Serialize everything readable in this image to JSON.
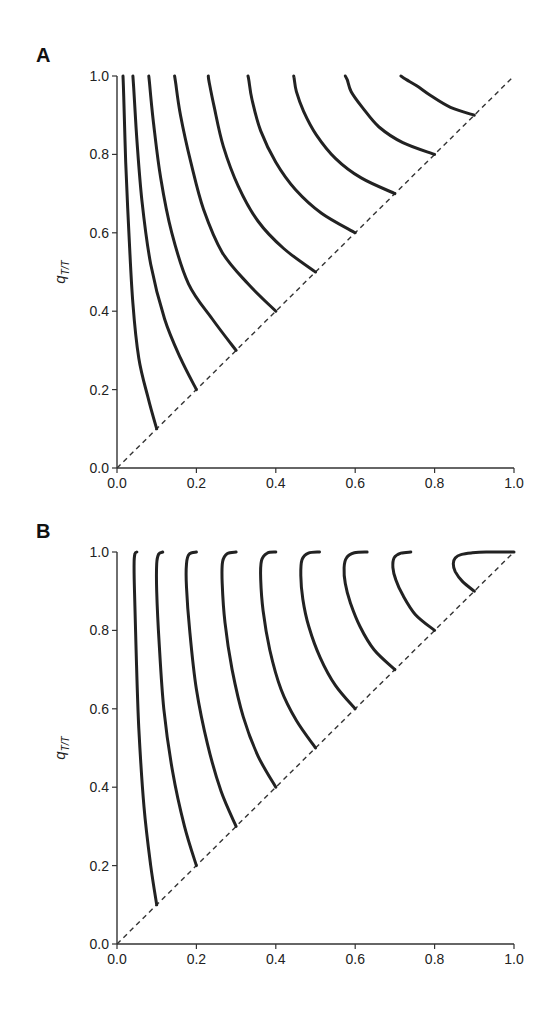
{
  "chart_data": [
    {
      "panel": "A",
      "type": "line",
      "title": "",
      "xlabel": "ρ_T",
      "ylabel": "q_T/T",
      "xlim": [
        0.0,
        1.0
      ],
      "ylim": [
        0.0,
        1.0
      ],
      "xticks": [
        "0.0",
        "0.2",
        "0.4",
        "0.6",
        "0.8",
        "1.0"
      ],
      "yticks": [
        "0.0",
        "0.2",
        "0.4",
        "0.6",
        "0.8",
        "1.0"
      ],
      "grid": false,
      "reference_line": {
        "style": "dashed",
        "equation": "q = ρ",
        "from": [
          0,
          0
        ],
        "to": [
          1,
          1
        ]
      },
      "series": [
        {
          "name": "ρ=0.1",
          "x": [
            0.1,
            0.078,
            0.055,
            0.04,
            0.03,
            0.022,
            0.017,
            0.015
          ],
          "y": [
            0.1,
            0.18,
            0.28,
            0.42,
            0.6,
            0.78,
            0.95,
            1.0
          ]
        },
        {
          "name": "ρ=0.2",
          "x": [
            0.2,
            0.16,
            0.12,
            0.085,
            0.063,
            0.05,
            0.042,
            0.04
          ],
          "y": [
            0.2,
            0.28,
            0.38,
            0.52,
            0.68,
            0.84,
            0.97,
            1.0
          ]
        },
        {
          "name": "ρ=0.3",
          "x": [
            0.3,
            0.24,
            0.18,
            0.138,
            0.11,
            0.092,
            0.082,
            0.08
          ],
          "y": [
            0.3,
            0.38,
            0.47,
            0.6,
            0.74,
            0.88,
            0.98,
            1.0
          ]
        },
        {
          "name": "ρ=0.4",
          "x": [
            0.4,
            0.33,
            0.265,
            0.218,
            0.186,
            0.16,
            0.148,
            0.145
          ],
          "y": [
            0.4,
            0.47,
            0.55,
            0.66,
            0.78,
            0.9,
            0.98,
            1.0
          ]
        },
        {
          "name": "ρ=0.5",
          "x": [
            0.5,
            0.42,
            0.355,
            0.305,
            0.268,
            0.245,
            0.232,
            0.23
          ],
          "y": [
            0.5,
            0.56,
            0.63,
            0.72,
            0.82,
            0.92,
            0.985,
            1.0
          ]
        },
        {
          "name": "ρ=0.6",
          "x": [
            0.6,
            0.515,
            0.45,
            0.4,
            0.362,
            0.34,
            0.332,
            0.33
          ],
          "y": [
            0.6,
            0.65,
            0.71,
            0.78,
            0.86,
            0.94,
            0.99,
            1.0
          ]
        },
        {
          "name": "ρ=0.7",
          "x": [
            0.7,
            0.615,
            0.55,
            0.502,
            0.47,
            0.452,
            0.446,
            0.445
          ],
          "y": [
            0.7,
            0.74,
            0.79,
            0.85,
            0.91,
            0.96,
            0.995,
            1.0
          ]
        },
        {
          "name": "ρ=0.8",
          "x": [
            0.8,
            0.72,
            0.66,
            0.618,
            0.59,
            0.58,
            0.575
          ],
          "y": [
            0.8,
            0.83,
            0.87,
            0.92,
            0.96,
            0.99,
            1.0
          ]
        },
        {
          "name": "ρ=0.9",
          "x": [
            0.9,
            0.84,
            0.79,
            0.755,
            0.73,
            0.718,
            0.715
          ],
          "y": [
            0.9,
            0.92,
            0.95,
            0.975,
            0.99,
            0.998,
            1.0
          ]
        }
      ]
    },
    {
      "panel": "B",
      "type": "line",
      "title": "",
      "xlabel": "ρ_T",
      "ylabel": "q_T/T",
      "xlim": [
        0.0,
        1.0
      ],
      "ylim": [
        0.0,
        1.0
      ],
      "xticks": [
        "0.0",
        "0.2",
        "0.4",
        "0.6",
        "0.8",
        "1.0"
      ],
      "yticks": [
        "0.0",
        "0.2",
        "0.4",
        "0.6",
        "0.8",
        "1.0"
      ],
      "grid": false,
      "reference_line": {
        "style": "dashed",
        "equation": "q = ρ",
        "from": [
          0,
          0
        ],
        "to": [
          1,
          1
        ]
      },
      "series": [
        {
          "name": "ρ=0.1",
          "x": [
            0.1,
            0.085,
            0.068,
            0.055,
            0.048,
            0.044,
            0.043,
            0.045,
            0.05
          ],
          "y": [
            0.1,
            0.2,
            0.35,
            0.55,
            0.75,
            0.9,
            0.97,
            0.995,
            1.0
          ]
        },
        {
          "name": "ρ=0.2",
          "x": [
            0.2,
            0.17,
            0.14,
            0.118,
            0.106,
            0.1,
            0.1,
            0.105,
            0.115
          ],
          "y": [
            0.2,
            0.3,
            0.44,
            0.6,
            0.77,
            0.9,
            0.97,
            0.995,
            1.0
          ]
        },
        {
          "name": "ρ=0.3",
          "x": [
            0.3,
            0.262,
            0.228,
            0.2,
            0.183,
            0.175,
            0.175,
            0.182,
            0.2
          ],
          "y": [
            0.3,
            0.39,
            0.51,
            0.65,
            0.8,
            0.91,
            0.97,
            0.995,
            1.0
          ]
        },
        {
          "name": "ρ=0.4",
          "x": [
            0.4,
            0.355,
            0.318,
            0.29,
            0.272,
            0.265,
            0.266,
            0.278,
            0.3
          ],
          "y": [
            0.4,
            0.48,
            0.58,
            0.7,
            0.82,
            0.92,
            0.975,
            0.996,
            1.0
          ]
        },
        {
          "name": "ρ=0.5",
          "x": [
            0.5,
            0.452,
            0.413,
            0.385,
            0.368,
            0.362,
            0.364,
            0.378,
            0.4
          ],
          "y": [
            0.5,
            0.57,
            0.65,
            0.75,
            0.85,
            0.93,
            0.978,
            0.997,
            1.0
          ]
        },
        {
          "name": "ρ=0.6",
          "x": [
            0.6,
            0.55,
            0.512,
            0.483,
            0.468,
            0.463,
            0.466,
            0.482,
            0.51
          ],
          "y": [
            0.6,
            0.66,
            0.73,
            0.81,
            0.88,
            0.94,
            0.98,
            0.997,
            1.0
          ]
        },
        {
          "name": "ρ=0.7",
          "x": [
            0.7,
            0.648,
            0.612,
            0.588,
            0.575,
            0.572,
            0.578,
            0.598,
            0.63
          ],
          "y": [
            0.7,
            0.75,
            0.81,
            0.87,
            0.92,
            0.96,
            0.985,
            0.998,
            1.0
          ]
        },
        {
          "name": "ρ=0.8",
          "x": [
            0.8,
            0.752,
            0.72,
            0.702,
            0.695,
            0.698,
            0.715,
            0.74
          ],
          "y": [
            0.8,
            0.84,
            0.89,
            0.93,
            0.96,
            0.985,
            0.997,
            1.0
          ]
        },
        {
          "name": "ρ=0.9",
          "x": [
            0.9,
            0.87,
            0.852,
            0.847,
            0.852,
            0.868,
            0.895,
            0.93,
            0.97,
            1.0
          ],
          "y": [
            0.9,
            0.925,
            0.95,
            0.97,
            0.985,
            0.994,
            0.998,
            1.0,
            1.0,
            1.0
          ]
        }
      ]
    }
  ],
  "panels": {
    "A": {
      "letter": "A",
      "ylabel_main": "q",
      "ylabel_sub": "T/T",
      "xlabel_main": "ρ",
      "xlabel_sub": "T"
    },
    "B": {
      "letter": "B",
      "ylabel_main": "q",
      "ylabel_sub": "T/T",
      "xlabel_main": "ρ",
      "xlabel_sub": "T"
    }
  }
}
